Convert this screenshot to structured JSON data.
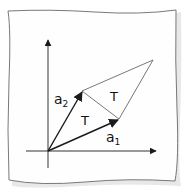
{
  "diagram": {
    "colors": {
      "background": "#ffffff",
      "paper": "#fefefe",
      "paper_edge": "#6a6a6a",
      "paper_shadow": "#d6d6d6",
      "ink": "#1a1a1a",
      "thin_line": "#555555"
    },
    "axes": {
      "x_axis": {
        "label": ""
      },
      "y_axis": {
        "label": ""
      }
    },
    "vectors": [
      {
        "id": "a1",
        "label": "a",
        "subscript": "1"
      },
      {
        "id": "a2",
        "label": "a",
        "subscript": "2"
      }
    ],
    "regions": [
      {
        "id": "triangle-lower",
        "label": "T"
      },
      {
        "id": "triangle-upper",
        "label": "T"
      }
    ]
  }
}
